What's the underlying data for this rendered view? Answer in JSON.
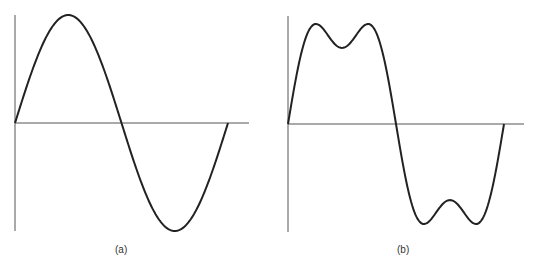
{
  "figure": {
    "panels": [
      {
        "label": "(a)",
        "description": "Pure sine wave, one full cycle",
        "axis_color": "#555555",
        "curve_color": "#222222"
      },
      {
        "label": "(b)",
        "description": "Sine wave with third-harmonic distortion (double-humped peaks)",
        "axis_color": "#555555",
        "curve_color": "#222222"
      }
    ]
  },
  "chart_data": [
    {
      "type": "line",
      "title": "(a)",
      "xlabel": "",
      "ylabel": "",
      "grid": false,
      "series": [
        {
          "name": "sin(t)",
          "fundamental": 1.0,
          "third_harmonic": 0.0
        }
      ],
      "x_range": [
        0,
        6.283
      ],
      "ylim": [
        -1,
        1
      ]
    },
    {
      "type": "line",
      "title": "(b)",
      "xlabel": "",
      "ylabel": "",
      "grid": false,
      "series": [
        {
          "name": "sin(t) + 0.3 sin(3t)",
          "fundamental": 1.0,
          "third_harmonic": 0.3
        }
      ],
      "x_range": [
        0,
        6.283
      ],
      "ylim": [
        -1,
        1
      ]
    }
  ]
}
